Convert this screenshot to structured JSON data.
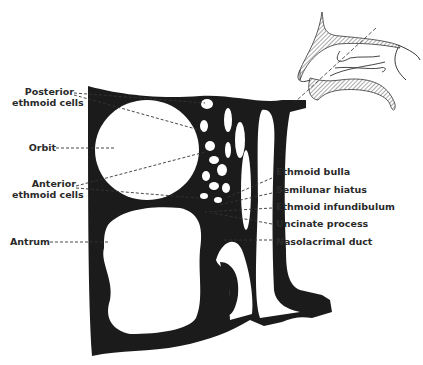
{
  "diagram": {
    "colors": {
      "bone": "#1b1b1b",
      "background": "#ffffff",
      "leader": "#333333",
      "hatch": "#555555"
    },
    "labels_left": [
      {
        "id": "posterior-ethmoid-cells",
        "line1": "Posterior",
        "line2": "ethmoid cells"
      },
      {
        "id": "orbit",
        "line1": "Orbit"
      },
      {
        "id": "anterior-ethmoid-cells",
        "line1": "Anterior",
        "line2": "ethmoid cells"
      },
      {
        "id": "antrum",
        "line1": "Antrum"
      }
    ],
    "labels_right": [
      {
        "id": "ethmoid-bulla",
        "text": "Ethmoid bulla"
      },
      {
        "id": "semilunar-hiatus",
        "text": "Semilunar hiatus"
      },
      {
        "id": "ethmoid-infundibulum",
        "text": "Ethmoid infundibulum"
      },
      {
        "id": "uncinate-process",
        "text": "Uncinate process"
      },
      {
        "id": "nasolacrimal-duct",
        "text": "Nasolacrimal duct"
      }
    ],
    "inset": {
      "description": "Lateral view of nose with section plane"
    }
  }
}
